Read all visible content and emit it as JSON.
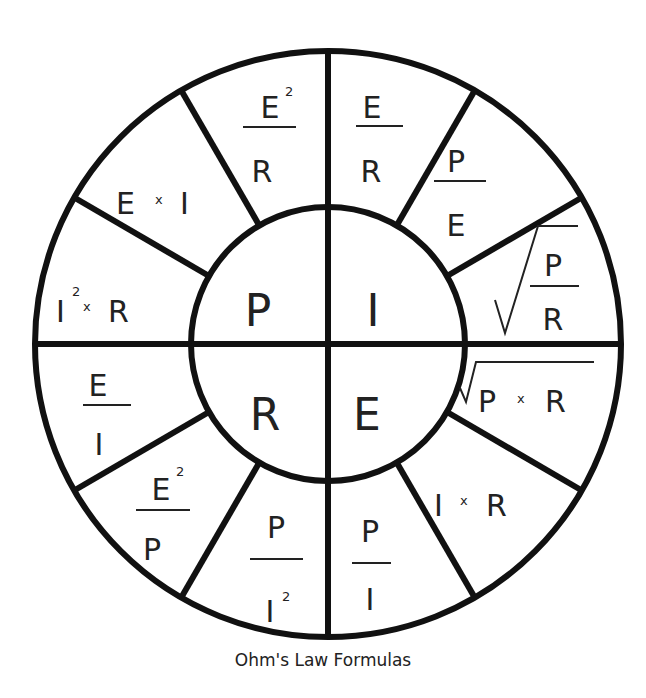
{
  "diagram": {
    "title": "Ohm's Law Formulas",
    "center_quadrants": [
      {
        "id": "P",
        "label": "P"
      },
      {
        "id": "I",
        "label": "I"
      },
      {
        "id": "R",
        "label": "R"
      },
      {
        "id": "E",
        "label": "E"
      }
    ],
    "segments": {
      "P": [
        {
          "formula": "I² × R",
          "base": "I",
          "sup": "2",
          "op": "x",
          "rhs": "R"
        },
        {
          "formula": "E × I",
          "lhs": "E",
          "op": "x",
          "rhs": "I"
        },
        {
          "formula": "E² / R",
          "num": "E",
          "sup": "2",
          "den": "R"
        }
      ],
      "I": [
        {
          "formula": "E / R",
          "num": "E",
          "den": "R"
        },
        {
          "formula": "P / E",
          "num": "P",
          "den": "E"
        },
        {
          "formula": "√(P / R)",
          "num": "P",
          "den": "R"
        }
      ],
      "E": [
        {
          "formula": "√(P × R)",
          "lhs": "P",
          "op": "x",
          "rhs": "R"
        },
        {
          "formula": "I × R",
          "lhs": "I",
          "op": "x",
          "rhs": "R"
        },
        {
          "formula": "P / I",
          "num": "P",
          "den": "I"
        }
      ],
      "R": [
        {
          "formula": "P / I²",
          "num": "P",
          "den": "I",
          "sup": "2"
        },
        {
          "formula": "E² / P",
          "num": "E",
          "sup": "2",
          "den": "P"
        },
        {
          "formula": "E / I",
          "num": "E",
          "den": "I"
        }
      ]
    }
  }
}
